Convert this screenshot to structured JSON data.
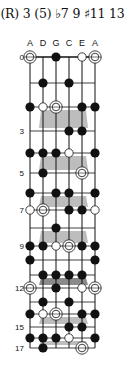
{
  "title": "(R) 3 (5) ♭7 9 ♯11 13",
  "strings": [
    "A",
    "D",
    "G",
    "C",
    "E",
    "A"
  ],
  "string_x": [
    30,
    43,
    56,
    69,
    82,
    95
  ],
  "fret_y": [
    57,
    83,
    107,
    131,
    153,
    173,
    193,
    210,
    228,
    246,
    260,
    275,
    288,
    302,
    314,
    327,
    338,
    348
  ],
  "fret_labels": [
    {
      "fret": 0,
      "label": "0"
    },
    {
      "fret": 3,
      "label": "3"
    },
    {
      "fret": 5,
      "label": "5"
    },
    {
      "fret": 7,
      "label": "7"
    },
    {
      "fret": 9,
      "label": "9"
    },
    {
      "fret": 12,
      "label": "12"
    },
    {
      "fret": 15,
      "label": "15"
    },
    {
      "fret": 17,
      "label": "17"
    }
  ],
  "shades": [
    {
      "from_fret": 2,
      "to_fret": 3,
      "tone": "light"
    },
    {
      "from_fret": 4,
      "to_fret": 5,
      "tone": "light"
    },
    {
      "from_fret": 6,
      "to_fret": 7,
      "tone": "light"
    },
    {
      "from_fret": 8,
      "to_fret": 9,
      "tone": "light"
    },
    {
      "from_fret": 11,
      "to_fret": 12,
      "tone": "dark"
    },
    {
      "from_fret": 14,
      "to_fret": 15,
      "tone": "light"
    },
    {
      "from_fret": 16,
      "to_fret": 17,
      "tone": "light"
    }
  ],
  "colors": {
    "light_shade": "#bdbdbd",
    "dark_shade": "#8a8a8a",
    "ink": "#111111"
  },
  "marker_legend": {
    "root": "double-circle",
    "optional": "open-circle",
    "tone": "filled-dot"
  },
  "markers": [
    {
      "fret": 0,
      "string": 0,
      "type": "root"
    },
    {
      "fret": 0,
      "string": 2,
      "type": "tone"
    },
    {
      "fret": 0,
      "string": 4,
      "type": "optional"
    },
    {
      "fret": 0,
      "string": 5,
      "type": "root"
    },
    {
      "fret": 1,
      "string": 1,
      "type": "tone"
    },
    {
      "fret": 1,
      "string": 3,
      "type": "tone"
    },
    {
      "fret": 2,
      "string": 0,
      "type": "tone"
    },
    {
      "fret": 2,
      "string": 1,
      "type": "optional"
    },
    {
      "fret": 2,
      "string": 2,
      "type": "root"
    },
    {
      "fret": 2,
      "string": 4,
      "type": "tone"
    },
    {
      "fret": 2,
      "string": 5,
      "type": "tone"
    },
    {
      "fret": 3,
      "string": 3,
      "type": "tone"
    },
    {
      "fret": 3,
      "string": 4,
      "type": "tone"
    },
    {
      "fret": 4,
      "string": 0,
      "type": "tone"
    },
    {
      "fret": 4,
      "string": 1,
      "type": "tone"
    },
    {
      "fret": 4,
      "string": 2,
      "type": "tone"
    },
    {
      "fret": 4,
      "string": 3,
      "type": "optional"
    },
    {
      "fret": 4,
      "string": 5,
      "type": "tone"
    },
    {
      "fret": 5,
      "string": 1,
      "type": "tone"
    },
    {
      "fret": 5,
      "string": 4,
      "type": "root"
    },
    {
      "fret": 6,
      "string": 0,
      "type": "tone"
    },
    {
      "fret": 6,
      "string": 2,
      "type": "tone"
    },
    {
      "fret": 6,
      "string": 3,
      "type": "tone"
    },
    {
      "fret": 6,
      "string": 5,
      "type": "tone"
    },
    {
      "fret": 7,
      "string": 0,
      "type": "optional"
    },
    {
      "fret": 7,
      "string": 1,
      "type": "root"
    },
    {
      "fret": 7,
      "string": 3,
      "type": "tone"
    },
    {
      "fret": 7,
      "string": 4,
      "type": "tone"
    },
    {
      "fret": 7,
      "string": 5,
      "type": "optional"
    },
    {
      "fret": 8,
      "string": 2,
      "type": "tone"
    },
    {
      "fret": 9,
      "string": 0,
      "type": "tone"
    },
    {
      "fret": 9,
      "string": 1,
      "type": "tone"
    },
    {
      "fret": 9,
      "string": 2,
      "type": "optional"
    },
    {
      "fret": 9,
      "string": 3,
      "type": "root"
    },
    {
      "fret": 9,
      "string": 4,
      "type": "tone"
    },
    {
      "fret": 9,
      "string": 5,
      "type": "tone"
    },
    {
      "fret": 10,
      "string": 0,
      "type": "tone"
    },
    {
      "fret": 10,
      "string": 5,
      "type": "tone"
    },
    {
      "fret": 11,
      "string": 1,
      "type": "tone"
    },
    {
      "fret": 11,
      "string": 2,
      "type": "tone"
    },
    {
      "fret": 11,
      "string": 3,
      "type": "tone"
    },
    {
      "fret": 11,
      "string": 4,
      "type": "tone"
    },
    {
      "fret": 12,
      "string": 0,
      "type": "root"
    },
    {
      "fret": 12,
      "string": 2,
      "type": "tone"
    },
    {
      "fret": 12,
      "string": 4,
      "type": "optional"
    },
    {
      "fret": 12,
      "string": 5,
      "type": "root"
    },
    {
      "fret": 13,
      "string": 1,
      "type": "tone"
    },
    {
      "fret": 13,
      "string": 3,
      "type": "tone"
    },
    {
      "fret": 14,
      "string": 0,
      "type": "tone"
    },
    {
      "fret": 14,
      "string": 1,
      "type": "optional"
    },
    {
      "fret": 14,
      "string": 2,
      "type": "root"
    },
    {
      "fret": 14,
      "string": 4,
      "type": "tone"
    },
    {
      "fret": 14,
      "string": 5,
      "type": "tone"
    },
    {
      "fret": 15,
      "string": 3,
      "type": "tone"
    },
    {
      "fret": 15,
      "string": 4,
      "type": "tone"
    },
    {
      "fret": 16,
      "string": 0,
      "type": "tone"
    },
    {
      "fret": 16,
      "string": 1,
      "type": "tone"
    },
    {
      "fret": 16,
      "string": 2,
      "type": "tone"
    },
    {
      "fret": 16,
      "string": 3,
      "type": "optional"
    },
    {
      "fret": 16,
      "string": 5,
      "type": "tone"
    },
    {
      "fret": 17,
      "string": 1,
      "type": "tone"
    },
    {
      "fret": 17,
      "string": 4,
      "type": "root"
    }
  ]
}
